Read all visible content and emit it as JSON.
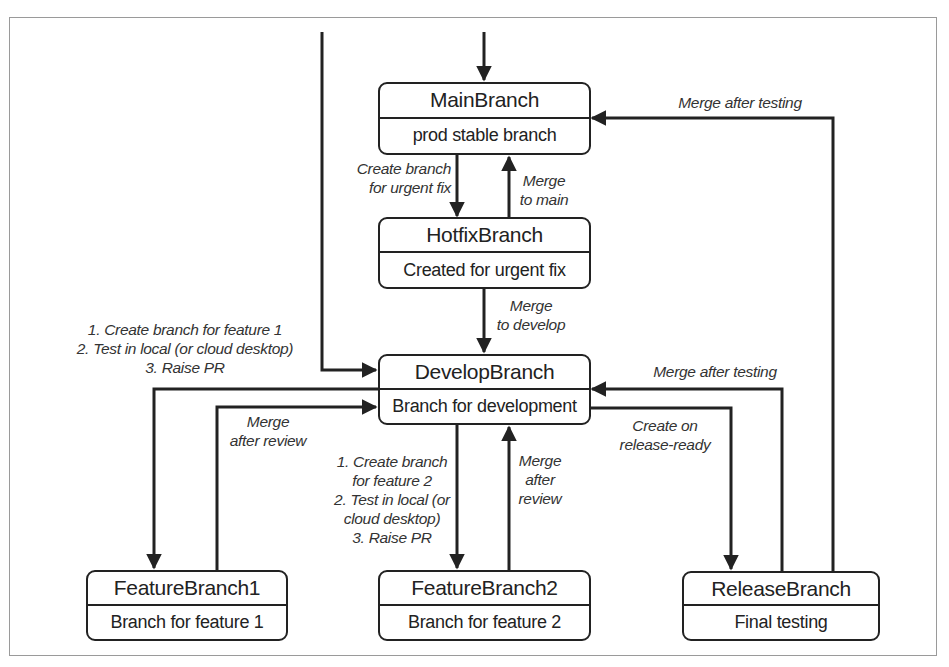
{
  "diagram": {
    "nodes": {
      "main": {
        "title": "MainBranch",
        "desc": "prod stable branch"
      },
      "hotfix": {
        "title": "HotfixBranch",
        "desc": "Created for urgent fix"
      },
      "develop": {
        "title": "DevelopBranch",
        "desc": "Branch for development"
      },
      "feature1": {
        "title": "FeatureBranch1",
        "desc": "Branch for feature 1"
      },
      "feature2": {
        "title": "FeatureBranch2",
        "desc": "Branch for feature 2"
      },
      "release": {
        "title": "ReleaseBranch",
        "desc": "Final testing"
      }
    },
    "edges": {
      "main_to_hotfix": {
        "lines": [
          "Create branch",
          "for urgent fix"
        ]
      },
      "hotfix_to_main": {
        "lines": [
          "Merge",
          "to main"
        ]
      },
      "hotfix_to_develop": {
        "lines": [
          "Merge",
          "to develop"
        ]
      },
      "release_to_main": {
        "lines": [
          "Merge after testing"
        ]
      },
      "develop_to_feature1": {
        "lines": [
          "1. Create branch for feature 1",
          "2. Test in local (or cloud desktop)",
          "3. Raise PR"
        ]
      },
      "feature1_to_develop": {
        "lines": [
          "Merge",
          "after review"
        ]
      },
      "develop_to_feature2": {
        "lines": [
          "1. Create branch",
          "for feature 2",
          "2. Test in local (or",
          "cloud desktop)",
          "3. Raise PR"
        ]
      },
      "feature2_to_develop": {
        "lines": [
          "Merge",
          "after",
          "review"
        ]
      },
      "release_to_develop": {
        "lines": [
          "Merge after testing"
        ]
      },
      "develop_to_release": {
        "lines": [
          "Create on",
          "release-ready"
        ]
      }
    },
    "colors": {
      "stroke": "#222222",
      "frame": "#9a9a9a",
      "background": "#ffffff"
    }
  }
}
